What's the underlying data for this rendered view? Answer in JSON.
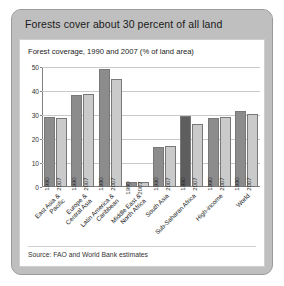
{
  "figure": {
    "title": "Forests cover about 30 percent of all land",
    "subtitle": "Forest coverage, 1990 and 2007 (% of land area)",
    "source": "Source: FAO and World Bank estimates"
  },
  "colors": {
    "title_bar_background": "#bfbfbf",
    "panel_background": "#ffffff",
    "series_1990": "#8c8c8c",
    "series_2007": "#cacaca",
    "series_1990_highlight": "#5e5e5e",
    "gridline": "#c9c9c9",
    "axis": "#808080"
  },
  "chart_data": {
    "type": "bar",
    "title": "Forest coverage, 1990 and 2007 (% of land area)",
    "xlabel": "",
    "ylabel": "",
    "ylim": [
      0,
      50
    ],
    "yticks": [
      0,
      10,
      20,
      30,
      40,
      50
    ],
    "grid": true,
    "legend_position": "none",
    "categories": [
      "East Asia & Pacific",
      "Europe & Central Asia",
      "Latin America & Caribbean",
      "Middle East & North Africa",
      "South Asia",
      "Sub-Saharan Africa",
      "High-income",
      "World"
    ],
    "series": [
      {
        "name": "1990",
        "values": [
          29.2,
          38.3,
          49.0,
          2.0,
          16.8,
          29.5,
          28.9,
          31.5
        ]
      },
      {
        "name": "2007",
        "values": [
          28.8,
          38.6,
          45.0,
          2.1,
          17.0,
          26.4,
          29.2,
          30.6
        ]
      }
    ],
    "bar_labels": [
      "1990",
      "2007"
    ]
  }
}
